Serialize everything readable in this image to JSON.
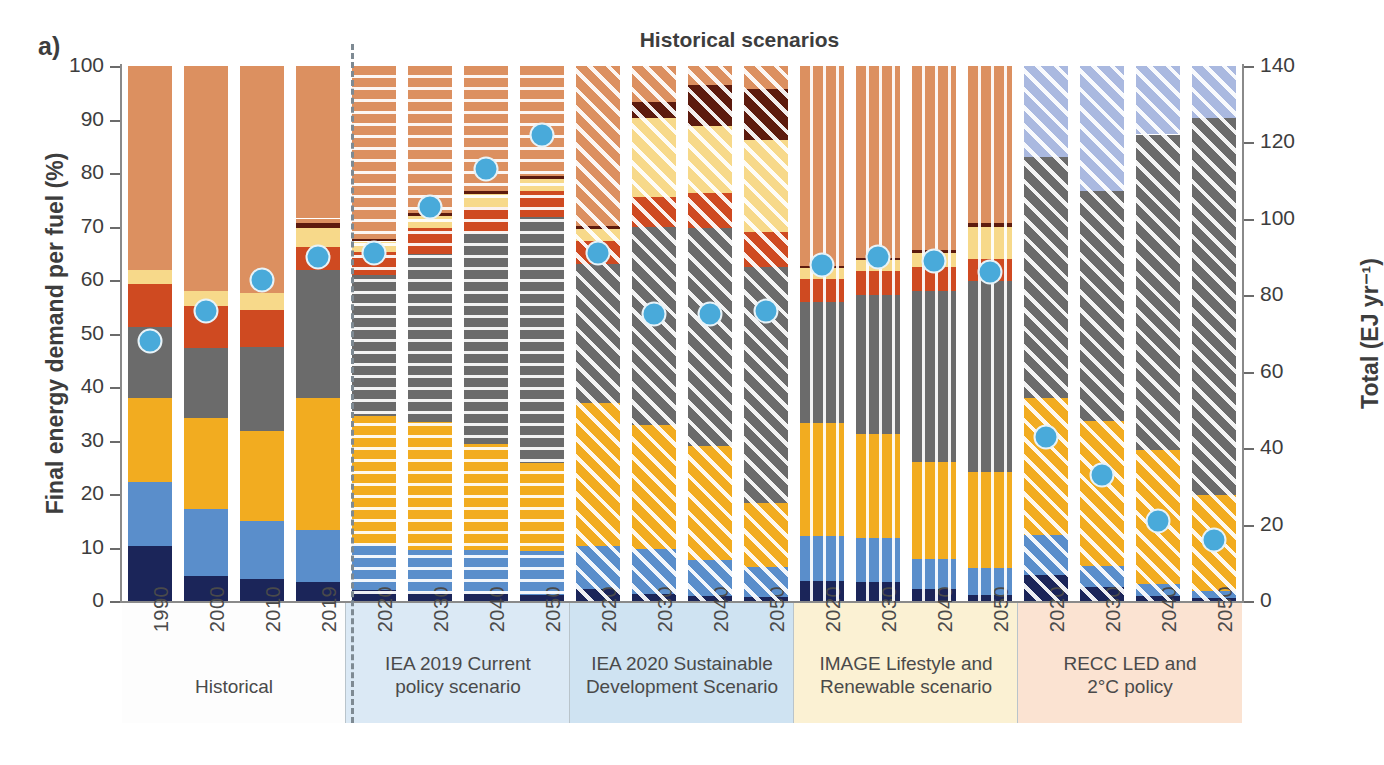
{
  "panel_letter": "a)",
  "axes": {
    "left_title": "Final energy demand per fuel (%)",
    "right_title": "Total (EJ yr⁻¹)",
    "left_ticks": [
      "0",
      "10",
      "20",
      "30",
      "40",
      "50",
      "60",
      "70",
      "80",
      "90",
      "100"
    ],
    "right_ticks": [
      "0",
      "20",
      "40",
      "60",
      "80",
      "100",
      "120",
      "140"
    ]
  },
  "chart_data": {
    "type": "bar",
    "title": "Historical scenarios",
    "xlabel": "",
    "ylabel": "Final energy demand per fuel (%)",
    "ylabel_secondary": "Total (EJ yr⁻¹)",
    "ylim": [
      0,
      100
    ],
    "ylim_secondary": [
      0,
      140
    ],
    "grid": false,
    "legend_position": "none",
    "stack_order_bottom_to_top": [
      "Coal",
      "Oil / liquids",
      "Gas",
      "Electricity",
      "Heat / district heat",
      "Hydrogen",
      "Biomass / traditional",
      "Other renewables",
      "Residual"
    ],
    "series_colors": {
      "Coal": "#1b2559",
      "Oil / liquids": "#5a8ecb",
      "Gas": "#f2ac20",
      "Electricity": "#6b6b6b",
      "Heat / district heat": "#cf4a21",
      "Hydrogen": "#aab9e0",
      "Biomass / traditional": "#f7d98a",
      "Other renewables": "#5d1b0e",
      "Residual": "#dc9060"
    },
    "marker": {
      "name": "Total final energy demand",
      "color": "#49aada",
      "edge_color": "#e8f3f8",
      "axis": "right"
    },
    "groups": [
      {
        "name": "Historical",
        "bg": "#fdfdfd",
        "hatch": "none",
        "bars": [
          {
            "x": "1990",
            "total_ej": 68,
            "values": {
              "Coal": 10.2,
              "Oil / liquids": 12.1,
              "Gas": 15.7,
              "Electricity": 13.2,
              "Heat / district heat": 8.0,
              "Hydrogen": 0.0,
              "Biomass / traditional": 2.6,
              "Other renewables": 0.0,
              "Residual": 0.2,
              "Top": 38.0
            }
          },
          {
            "x": "2000",
            "total_ej": 76,
            "values": {
              "Coal": 4.6,
              "Oil / liquids": 12.6,
              "Gas": 17.0,
              "Electricity": 13.0,
              "Heat / district heat": 8.0,
              "Hydrogen": 0.0,
              "Biomass / traditional": 2.8,
              "Other renewables": 0.0,
              "Residual": 0.2,
              "Top": 41.8
            }
          },
          {
            "x": "2010",
            "total_ej": 84,
            "values": {
              "Coal": 4.2,
              "Oil / liquids": 10.7,
              "Gas": 16.9,
              "Electricity": 15.6,
              "Heat / district heat": 7.0,
              "Hydrogen": 0.0,
              "Biomass / traditional": 3.2,
              "Other renewables": 0.0,
              "Residual": 0.4,
              "Top": 42.0
            }
          },
          {
            "x": "2019",
            "total_ej": 90,
            "values": {
              "Coal": 3.6,
              "Oil / liquids": 9.7,
              "Gas": 24.6,
              "Electricity": 23.9,
              "Heat / district heat": 4.3,
              "Hydrogen": 0.0,
              "Biomass / traditional": 3.7,
              "Other renewables": 0.9,
              "Residual": 0.8,
              "Top": 28.5
            }
          }
        ]
      },
      {
        "name": "IEA 2019 Current\npolicy scenario",
        "bg": "#dbe9f5",
        "hatch": "horizontal",
        "bars": [
          {
            "x": "2020",
            "total_ej": 91,
            "values": {
              "Coal": 2.0,
              "Oil / liquids": 8.6,
              "Gas": 24.0,
              "Electricity": 26.4,
              "Heat / district heat": 4.2,
              "Hydrogen": 0.0,
              "Biomass / traditional": 2.0,
              "Other renewables": 0.5,
              "Residual": 0.4,
              "Top": 31.9
            }
          },
          {
            "x": "2030",
            "total_ej": 103,
            "values": {
              "Coal": 1.6,
              "Oil / liquids": 8.0,
              "Gas": 23.8,
              "Electricity": 31.4,
              "Heat / district heat": 5.0,
              "Hydrogen": 0.0,
              "Biomass / traditional": 2.2,
              "Other renewables": 0.6,
              "Residual": 0.5,
              "Top": 26.9
            }
          },
          {
            "x": "2040",
            "total_ej": 113,
            "values": {
              "Coal": 1.3,
              "Oil / liquids": 8.2,
              "Gas": 19.8,
              "Electricity": 39.5,
              "Heat / district heat": 4.9,
              "Hydrogen": 0.0,
              "Biomass / traditional": 2.3,
              "Other renewables": 0.7,
              "Residual": 0.5,
              "Top": 22.8
            }
          },
          {
            "x": "2050",
            "total_ej": 122,
            "values": {
              "Coal": 1.1,
              "Oil / liquids": 8.2,
              "Gas": 16.5,
              "Electricity": 46.0,
              "Heat / district heat": 4.8,
              "Hydrogen": 0.0,
              "Biomass / traditional": 2.2,
              "Other renewables": 0.7,
              "Residual": 0.5,
              "Top": 20.0
            }
          }
        ]
      },
      {
        "name": "IEA 2020 Sustainable\nDevelopment Scenario",
        "bg": "#cfe3f2",
        "hatch": "diagonal",
        "bars": [
          {
            "x": "2020",
            "total_ej": 91,
            "values": {
              "Coal": 2.2,
              "Oil / liquids": 8.0,
              "Gas": 26.8,
              "Electricity": 26.0,
              "Heat / district heat": 4.3,
              "Hydrogen": 0.0,
              "Biomass / traditional": 2.2,
              "Other renewables": 0.6,
              "Residual": 0.6,
              "Top": 29.3
            }
          },
          {
            "x": "2030",
            "total_ej": 75,
            "values": {
              "Coal": 1.3,
              "Oil / liquids": 8.4,
              "Gas": 23.2,
              "Electricity": 37.1,
              "Heat / district heat": 5.5,
              "Hydrogen": 0.0,
              "Biomass / traditional": 14.8,
              "Other renewables": 3.0,
              "Residual": 3.9,
              "Top": 2.8
            }
          },
          {
            "x": "2040",
            "total_ej": 75,
            "values": {
              "Coal": 0.9,
              "Oil / liquids": 6.8,
              "Gas": 21.2,
              "Electricity": 40.8,
              "Heat / district heat": 6.5,
              "Hydrogen": 0.0,
              "Biomass / traditional": 12.6,
              "Other renewables": 7.6,
              "Residual": 2.4,
              "Top": 1.2
            }
          },
          {
            "x": "2050",
            "total_ej": 76,
            "values": {
              "Coal": 0.7,
              "Oil / liquids": 5.6,
              "Gas": 12.0,
              "Electricity": 44.2,
              "Heat / district heat": 6.5,
              "Hydrogen": 0.0,
              "Biomass / traditional": 17.2,
              "Other renewables": 9.5,
              "Residual": 3.0,
              "Top": 1.3
            }
          }
        ]
      },
      {
        "name": "IMAGE Lifestyle and\nRenewable scenario",
        "bg": "#fbf1d3",
        "hatch": "vertical",
        "bars": [
          {
            "x": "2020",
            "total_ej": 88,
            "values": {
              "Coal": 3.7,
              "Oil / liquids": 8.4,
              "Gas": 21.1,
              "Electricity": 22.6,
              "Heat / district heat": 4.4,
              "Hydrogen": 0.0,
              "Biomass / traditional": 2.0,
              "Other renewables": 0.5,
              "Residual": 0.4,
              "Top": 36.9
            }
          },
          {
            "x": "2030",
            "total_ej": 90,
            "values": {
              "Coal": 3.6,
              "Oil / liquids": 8.1,
              "Gas": 19.5,
              "Electricity": 26.0,
              "Heat / district heat": 4.4,
              "Hydrogen": 0.0,
              "Biomass / traditional": 2.1,
              "Other renewables": 0.5,
              "Residual": 0.5,
              "Top": 35.3
            }
          },
          {
            "x": "2040",
            "total_ej": 89,
            "values": {
              "Coal": 2.3,
              "Oil / liquids": 5.5,
              "Gas": 18.2,
              "Electricity": 32.0,
              "Heat / district heat": 4.5,
              "Hydrogen": 0.0,
              "Biomass / traditional": 2.6,
              "Other renewables": 0.6,
              "Residual": 0.5,
              "Top": 33.8
            }
          },
          {
            "x": "2050",
            "total_ej": 86,
            "values": {
              "Coal": 1.1,
              "Oil / liquids": 5.0,
              "Gas": 18.0,
              "Electricity": 35.8,
              "Heat / district heat": 4.0,
              "Hydrogen": 0.0,
              "Biomass / traditional": 6.0,
              "Other renewables": 0.7,
              "Residual": 0.5,
              "Top": 28.9
            }
          }
        ]
      },
      {
        "name": "RECC LED and\n2°C policy",
        "bg": "#fbe3d2",
        "hatch": "diagonal",
        "bars": [
          {
            "x": "2020",
            "total_ej": 43,
            "values": {
              "Coal": 4.8,
              "Oil / liquids": 7.6,
              "Gas": 25.5,
              "Electricity": 45.1,
              "Heat / district heat": 0.0,
              "Hydrogen": 17.0,
              "Biomass / traditional": 0.0,
              "Other renewables": 0.0,
              "Residual": 0.0,
              "Top": 0.0
            }
          },
          {
            "x": "2030",
            "total_ej": 33,
            "values": {
              "Coal": 2.6,
              "Oil / liquids": 4.0,
              "Gas": 27.0,
              "Electricity": 43.0,
              "Heat / district heat": 0.0,
              "Hydrogen": 23.4,
              "Biomass / traditional": 0.0,
              "Other renewables": 0.0,
              "Residual": 0.0,
              "Top": 0.0
            }
          },
          {
            "x": "2040",
            "total_ej": 21,
            "values": {
              "Coal": 1.0,
              "Oil / liquids": 2.1,
              "Gas": 25.1,
              "Electricity": 59.0,
              "Heat / district heat": 0.0,
              "Hydrogen": 12.8,
              "Biomass / traditional": 0.0,
              "Other renewables": 0.0,
              "Residual": 0.0,
              "Top": 0.0
            }
          },
          {
            "x": "2050",
            "total_ej": 16,
            "values": {
              "Coal": 0.6,
              "Oil / liquids": 1.2,
              "Gas": 18.0,
              "Electricity": 70.4,
              "Heat / district heat": 0.0,
              "Hydrogen": 9.8,
              "Biomass / traditional": 0.0,
              "Other renewables": 0.0,
              "Residual": 0.0,
              "Top": 0.0
            }
          }
        ]
      }
    ]
  }
}
